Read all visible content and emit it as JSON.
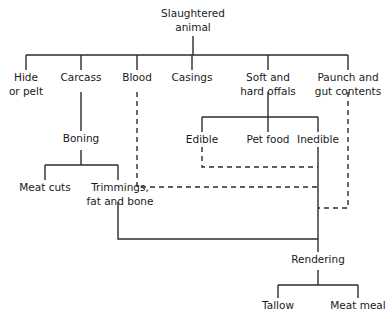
{
  "diagram": {
    "type": "flowchart",
    "title_node": "Slaughtered animal",
    "orientation": "top-down",
    "line_styles": [
      "solid",
      "dashed"
    ],
    "colors": {
      "line": "#2b2b2b",
      "text": "#1a1a1a",
      "background": "#ffffff"
    },
    "nodes": {
      "slaughtered_animal_l1": "Slaughtered",
      "slaughtered_animal_l2": "animal",
      "hide_or_pelt_l1": "Hide",
      "hide_or_pelt_l2": "or pelt",
      "carcass": "Carcass",
      "blood": "Blood",
      "casings": "Casings",
      "offals_l1": "Soft and",
      "offals_l2": "hard offals",
      "paunch_l1": "Paunch and",
      "paunch_l2": "gut contents",
      "boning": "Boning",
      "edible": "Edible",
      "pet_food": "Pet food",
      "inedible": "Inedible",
      "meat_cuts": "Meat cuts",
      "trimmings_l1": "Trimmings,",
      "trimmings_l2": "fat and bone",
      "rendering": "Rendering",
      "tallow": "Tallow",
      "meat_meal": "Meat meal"
    },
    "edges": [
      {
        "from": "Slaughtered animal",
        "to": "Hide or pelt",
        "style": "solid"
      },
      {
        "from": "Slaughtered animal",
        "to": "Carcass",
        "style": "solid"
      },
      {
        "from": "Slaughtered animal",
        "to": "Blood",
        "style": "solid"
      },
      {
        "from": "Slaughtered animal",
        "to": "Casings",
        "style": "solid"
      },
      {
        "from": "Slaughtered animal",
        "to": "Soft and hard offals",
        "style": "solid"
      },
      {
        "from": "Slaughtered animal",
        "to": "Paunch and gut contents",
        "style": "solid"
      },
      {
        "from": "Carcass",
        "to": "Boning",
        "style": "solid"
      },
      {
        "from": "Boning",
        "to": "Meat cuts",
        "style": "solid"
      },
      {
        "from": "Boning",
        "to": "Trimmings, fat and bone",
        "style": "solid"
      },
      {
        "from": "Soft and hard offals",
        "to": "Edible",
        "style": "solid"
      },
      {
        "from": "Soft and hard offals",
        "to": "Pet food",
        "style": "solid"
      },
      {
        "from": "Soft and hard offals",
        "to": "Inedible",
        "style": "solid"
      },
      {
        "from": "Trimmings, fat and bone",
        "to": "Rendering",
        "style": "solid"
      },
      {
        "from": "Edible",
        "to": "Rendering",
        "style": "dashed"
      },
      {
        "from": "Inedible",
        "to": "Rendering",
        "style": "dashed"
      },
      {
        "from": "Blood",
        "to": "Rendering",
        "style": "dashed"
      },
      {
        "from": "Paunch and gut contents",
        "to": "Rendering",
        "style": "dashed"
      },
      {
        "from": "Rendering",
        "to": "Tallow",
        "style": "solid"
      },
      {
        "from": "Rendering",
        "to": "Meat meal",
        "style": "solid"
      }
    ]
  }
}
